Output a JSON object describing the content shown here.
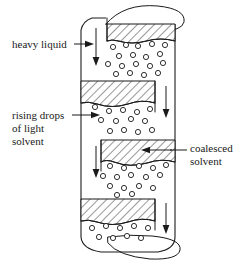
{
  "figure": {
    "title": "",
    "type": "technical-diagram",
    "background_color": "#ffffff",
    "line_color": "#1a1a1a"
  },
  "labels": {
    "heavy_liquid": {
      "text": "heavy liquid",
      "lines": [
        "heavy liquid"
      ],
      "position": "left",
      "points_to": "column-top-inlet"
    },
    "rising_drops": {
      "text": "rising drops of light solvent",
      "lines": [
        "rising drops",
        "of light",
        "solvent"
      ],
      "position": "left",
      "points_to": "drop-field"
    },
    "coalesced_solvent": {
      "text": "coalesced solvent",
      "lines": [
        "coalesced",
        "solvent"
      ],
      "position": "right",
      "points_to": "hatched-baffle"
    }
  },
  "column": {
    "left_wall_x": 81,
    "right_wall_x": 175,
    "top_y": 18,
    "bottom_y": 248,
    "baffles": [
      {
        "name": "top-hatched-band",
        "attached": "full",
        "y": 24,
        "height": 17
      },
      {
        "name": "baffle-1",
        "attached": "left",
        "y": 81,
        "height": 22
      },
      {
        "name": "baffle-2",
        "attached": "right",
        "y": 140,
        "height": 22
      },
      {
        "name": "baffle-3",
        "attached": "left",
        "y": 199,
        "height": 22
      }
    ],
    "flow_arrows": [
      {
        "name": "heavy-liquid-down-top",
        "x": 96,
        "direction": "down"
      },
      {
        "name": "heavy-liquid-down-right-1",
        "x": 166,
        "direction": "down"
      },
      {
        "name": "heavy-liquid-down-left-2",
        "x": 96,
        "direction": "down"
      },
      {
        "name": "heavy-liquid-down-right-3",
        "x": 166,
        "direction": "down"
      }
    ]
  },
  "icons": {
    "arrow_down": "arrow-down-icon",
    "leader_arrow_right": "arrow-right-icon",
    "leader_arrow_left": "arrow-left-icon"
  }
}
